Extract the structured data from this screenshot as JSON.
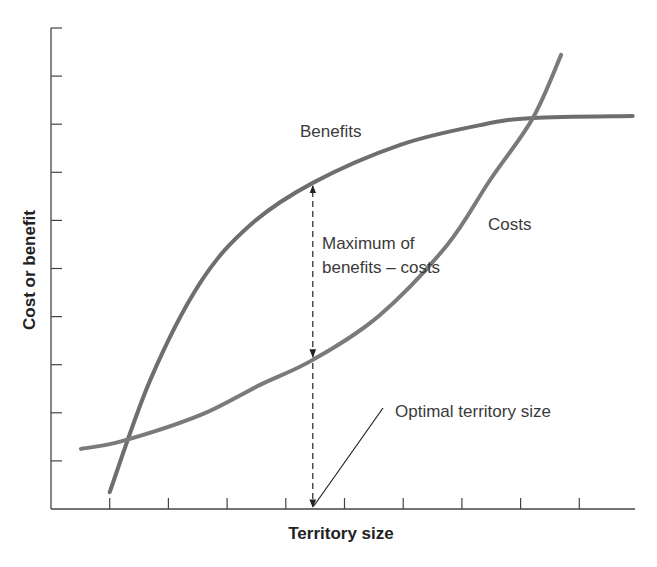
{
  "chart_data": {
    "type": "line",
    "title": "",
    "xlabel": "Territory size",
    "ylabel": "Cost or benefit",
    "xlim": [
      0,
      10
    ],
    "ylim": [
      0,
      10
    ],
    "x_ticks": [
      1,
      2,
      3,
      4,
      5,
      6,
      7,
      8,
      9
    ],
    "y_ticks": [
      1,
      2,
      3,
      4,
      5,
      6,
      7,
      8,
      9,
      10
    ],
    "tick_labels_shown": false,
    "grid": false,
    "legend": "none",
    "series": [
      {
        "name": "Benefits",
        "color": "#6e6e6e",
        "points": [
          [
            1.0,
            0.35
          ],
          [
            1.69,
            2.68
          ],
          [
            2.54,
            4.7
          ],
          [
            3.39,
            5.9
          ],
          [
            4.46,
            6.78
          ],
          [
            5.95,
            7.57
          ],
          [
            7.31,
            7.98
          ],
          [
            8.21,
            8.13
          ],
          [
            9.91,
            8.17
          ]
        ]
      },
      {
        "name": "Costs",
        "color": "#7a7a7a",
        "points": [
          [
            0.51,
            1.25
          ],
          [
            1.21,
            1.41
          ],
          [
            2.54,
            1.95
          ],
          [
            3.56,
            2.58
          ],
          [
            4.46,
            3.1
          ],
          [
            5.6,
            4.03
          ],
          [
            6.75,
            5.49
          ],
          [
            7.48,
            6.84
          ],
          [
            8.21,
            8.13
          ],
          [
            8.69,
            9.44
          ]
        ]
      }
    ],
    "annotations": [
      {
        "text": "Benefits",
        "label_for": "Benefits"
      },
      {
        "text": "Costs",
        "label_for": "Costs"
      },
      {
        "text_lines": [
          "Maximum of",
          "benefits – costs"
        ],
        "type": "double-arrow",
        "x": 4.46,
        "y_from": 3.1,
        "y_to": 6.78
      },
      {
        "text": "Optimal territory size",
        "type": "pointer",
        "x": 4.46,
        "y": 0
      }
    ]
  }
}
